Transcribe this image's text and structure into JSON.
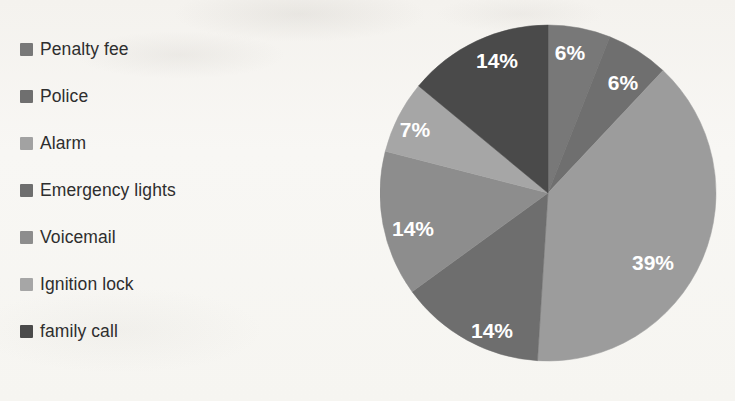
{
  "chart_data": {
    "type": "pie",
    "title": "",
    "labels": [
      "Penalty fee",
      "Police",
      "Alarm",
      "Emergency lights",
      "Voicemail",
      "Ignition lock",
      "family call"
    ],
    "values": [
      6,
      6,
      39,
      14,
      14,
      7,
      14
    ],
    "value_labels": [
      "6%",
      "6%",
      "39%",
      "14%",
      "14%",
      "7%",
      "14%"
    ],
    "units": "percent",
    "start_angle_deg": 0,
    "direction": "clockwise",
    "legend_position": "left",
    "grid": false,
    "colors": [
      "#787878",
      "#6f6f6f",
      "#9c9c9c",
      "#6e6e6e",
      "#8d8d8d",
      "#a6a6a6",
      "#4a4a4a"
    ],
    "label_color": "#ffffff",
    "background_color": "#f7f6f3",
    "series": [
      {
        "name": "Penalty fee",
        "value": 6,
        "label": "6%",
        "color": "#787878"
      },
      {
        "name": "Police",
        "value": 6,
        "label": "6%",
        "color": "#6f6f6f"
      },
      {
        "name": "Alarm",
        "value": 39,
        "label": "39%",
        "color": "#9c9c9c"
      },
      {
        "name": "Emergency lights",
        "value": 14,
        "label": "14%",
        "color": "#6e6e6e"
      },
      {
        "name": "Voicemail",
        "value": 14,
        "label": "14%",
        "color": "#8d8d8d"
      },
      {
        "name": "Ignition lock",
        "value": 7,
        "label": "7%",
        "color": "#a6a6a6"
      },
      {
        "name": "family call",
        "value": 14,
        "label": "14%",
        "color": "#4a4a4a"
      }
    ]
  },
  "legend": {
    "items": [
      {
        "label": "Penalty fee",
        "color": "#787878"
      },
      {
        "label": "Police",
        "color": "#6f6f6f"
      },
      {
        "label": "Alarm",
        "color": "#a2a2a2"
      },
      {
        "label": "Emergency lights",
        "color": "#6e6e6e"
      },
      {
        "label": "Voicemail",
        "color": "#8d8d8d"
      },
      {
        "label": "Ignition lock",
        "color": "#a6a6a6"
      },
      {
        "label": "family call",
        "color": "#4a4a4a"
      }
    ]
  },
  "pie_labels": [
    {
      "text": "6%",
      "x": 190,
      "y": 42
    },
    {
      "text": "6%",
      "x": 243,
      "y": 72
    },
    {
      "text": "39%",
      "x": 273,
      "y": 252
    },
    {
      "text": "14%",
      "x": 112,
      "y": 320
    },
    {
      "text": "14%",
      "x": 33,
      "y": 218
    },
    {
      "text": "7%",
      "x": 35,
      "y": 119
    },
    {
      "text": "14%",
      "x": 117,
      "y": 50
    }
  ]
}
